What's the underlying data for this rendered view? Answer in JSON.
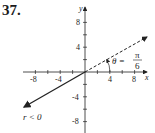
{
  "problem_number": "37.",
  "diagram": {
    "x_axis_label": "x",
    "y_axis_label": "y",
    "x_ticks": [
      "-8",
      "-4",
      "4",
      "8"
    ],
    "y_ticks": [
      "8",
      "4",
      "-4",
      "-8"
    ],
    "angle_label": "θ = ",
    "angle_num": "π",
    "angle_den": "6",
    "ray_label": "r < 0",
    "colors": {
      "line": "#222222"
    }
  }
}
